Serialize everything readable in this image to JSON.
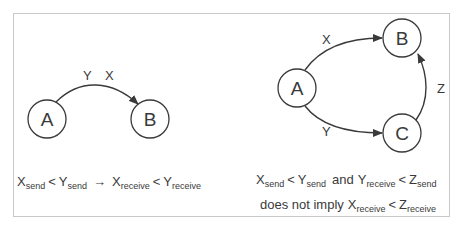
{
  "left_panel": {
    "nodes": [
      {
        "id": "A",
        "label": "A",
        "cx": 47,
        "cy": 119
      },
      {
        "id": "B",
        "label": "B",
        "cx": 150,
        "cy": 119
      }
    ],
    "edge": {
      "from": "A",
      "to": "B",
      "labels": [
        "Y",
        "X"
      ]
    },
    "caption": {
      "x_send": "X",
      "x_send_sub": "send",
      "lt1": "<",
      "y_send": "Y",
      "y_send_sub": "send",
      "arrow": "→",
      "x_recv": "X",
      "x_recv_sub": "receive",
      "lt2": "<",
      "y_recv": "Y",
      "y_recv_sub": "receive"
    }
  },
  "right_panel": {
    "nodes": [
      {
        "id": "A",
        "label": "A",
        "cx": 297,
        "cy": 88
      },
      {
        "id": "B",
        "label": "B",
        "cx": 402,
        "cy": 38
      },
      {
        "id": "C",
        "label": "C",
        "cx": 402,
        "cy": 133
      }
    ],
    "edges": [
      {
        "from": "A",
        "to": "B",
        "label": "X"
      },
      {
        "from": "A",
        "to": "C",
        "label": "Y"
      },
      {
        "from": "C",
        "to": "B",
        "label": "Z"
      }
    ],
    "caption_line1": {
      "x_send": "X",
      "x_send_sub": "send",
      "lt1": "<",
      "y_send": "Y",
      "y_send_sub": "send",
      "and": "and",
      "y_recv": "Y",
      "y_recv_sub": "receive",
      "lt2": "<",
      "z_send": "Z",
      "z_send_sub": "send"
    },
    "caption_line2": {
      "prefix": "does not imply",
      "x_recv": "X",
      "x_recv_sub": "receive",
      "lt": "<",
      "z_recv": "Z",
      "z_recv_sub": "receive"
    }
  },
  "colors": {
    "stroke": "#3a3a3a",
    "border": "#c8c8c8",
    "background": "#ffffff"
  }
}
